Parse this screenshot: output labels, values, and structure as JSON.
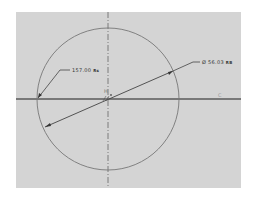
{
  "sketch": {
    "background": "#d4d4d4",
    "circle": {
      "cx": 108,
      "cy": 99,
      "r": 71,
      "color": "#6a6a6a"
    },
    "centerlines": {
      "horizontal_y": 99,
      "vertical_x": 108,
      "color": "#6a6a6a"
    },
    "dimensions": {
      "angle": {
        "text": "157.00",
        "unit_tag": "Rs"
      },
      "diameter": {
        "text": "Ø 56.03",
        "unit_tag": "RB"
      }
    },
    "constraint_markers": {
      "horizontal": "H",
      "origin": "⊥"
    },
    "axis_label": "C"
  }
}
